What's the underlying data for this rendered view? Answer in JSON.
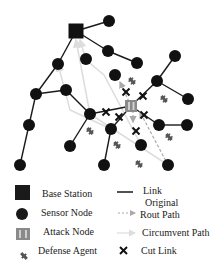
{
  "colors": {
    "link": "#1a1a1a",
    "node": "#111111",
    "base_station": "#111111",
    "attack_node": "#8a8a8a",
    "original_path": "#aaaaaa",
    "circumvent_path": "#dddddd",
    "cut_link": "#111111",
    "defense_agent": "#555555"
  },
  "base_station": {
    "x": 76,
    "y": 31,
    "size": 15
  },
  "attack_node": {
    "x": 131,
    "y": 106,
    "size": 12
  },
  "nodes": [
    {
      "id": "n1",
      "x": 109,
      "y": 21
    },
    {
      "id": "n2",
      "x": 86,
      "y": 59
    },
    {
      "id": "n3",
      "x": 108,
      "y": 51
    },
    {
      "id": "n4",
      "x": 137,
      "y": 63
    },
    {
      "id": "n5",
      "x": 58,
      "y": 64
    },
    {
      "id": "n6",
      "x": 115,
      "y": 75
    },
    {
      "id": "n7",
      "x": 175,
      "y": 56
    },
    {
      "id": "n8",
      "x": 157,
      "y": 81
    },
    {
      "id": "n9",
      "x": 188,
      "y": 99
    },
    {
      "id": "n10",
      "x": 36,
      "y": 94
    },
    {
      "id": "n11",
      "x": 66,
      "y": 90
    },
    {
      "id": "n12",
      "x": 90,
      "y": 114
    },
    {
      "id": "n13",
      "x": 29,
      "y": 125
    },
    {
      "id": "n14",
      "x": 111,
      "y": 129
    },
    {
      "id": "n15",
      "x": 159,
      "y": 125
    },
    {
      "id": "n16",
      "x": 187,
      "y": 125
    },
    {
      "id": "n17",
      "x": 70,
      "y": 146
    },
    {
      "id": "n18",
      "x": 141,
      "y": 145
    },
    {
      "id": "n19",
      "x": 20,
      "y": 165
    },
    {
      "id": "n20",
      "x": 104,
      "y": 165
    },
    {
      "id": "n21",
      "x": 168,
      "y": 165
    }
  ],
  "links": [
    [
      "bs",
      "n1"
    ],
    [
      "bs",
      "n5"
    ],
    [
      "bs",
      "n3"
    ],
    [
      "n3",
      "n4"
    ],
    [
      "n5",
      "n10"
    ],
    [
      "n10",
      "n11"
    ],
    [
      "n10",
      "n13"
    ],
    [
      "n13",
      "n19"
    ],
    [
      "n11",
      "n12"
    ],
    [
      "n12",
      "n17"
    ],
    [
      "n12",
      "atk"
    ],
    [
      "n7",
      "n8"
    ],
    [
      "n8",
      "n9"
    ],
    [
      "n8",
      "atk"
    ],
    [
      "n15",
      "n16"
    ],
    [
      "atk",
      "n15"
    ],
    [
      "atk",
      "n14"
    ],
    [
      "n14",
      "n20"
    ]
  ],
  "original_paths": [
    {
      "from": [
        131,
        106
      ],
      "to": [
        120,
        82
      ]
    },
    {
      "from": [
        133,
        110
      ],
      "to": [
        133,
        122
      ]
    },
    {
      "from": [
        168,
        165
      ],
      "to": [
        140,
        112
      ]
    }
  ],
  "circumvent_paths": [
    [
      [
        168,
        165
      ],
      [
        90,
        114
      ],
      [
        76,
        40
      ]
    ],
    [
      [
        141,
        145
      ],
      [
        104,
        75
      ],
      [
        86,
        60
      ],
      [
        80,
        40
      ]
    ],
    [
      [
        111,
        129
      ],
      [
        70,
        110
      ],
      [
        58,
        64
      ]
    ]
  ],
  "cut_links": [
    {
      "x": 126,
      "y": 92
    },
    {
      "x": 143,
      "y": 96
    },
    {
      "x": 106,
      "y": 112
    },
    {
      "x": 119,
      "y": 117
    },
    {
      "x": 144,
      "y": 115
    },
    {
      "x": 136,
      "y": 131
    }
  ],
  "defense_agents": [
    {
      "x": 132,
      "y": 81
    },
    {
      "x": 164,
      "y": 99
    },
    {
      "x": 90,
      "y": 131
    },
    {
      "x": 117,
      "y": 145
    },
    {
      "x": 169,
      "y": 137
    },
    {
      "x": 139,
      "y": 164
    }
  ],
  "legend": {
    "left": [
      {
        "icon": "base-station-icon",
        "label": "Base Station"
      },
      {
        "icon": "sensor-node-icon",
        "label": "Sensor Node"
      },
      {
        "icon": "attack-node-icon",
        "label": "Attack Node"
      },
      {
        "icon": "defense-agent-icon",
        "label": "Defense Agent"
      }
    ],
    "right": [
      {
        "icon": "link-line-icon",
        "label": "Link"
      },
      {
        "icon": "original-path-arrow-icon",
        "label_line1": "Original",
        "label_line2": "Rout Path"
      },
      {
        "icon": "circumvent-path-arrow-icon",
        "label": "Circumvent Path"
      },
      {
        "icon": "cut-link-icon",
        "label": "Cut Link"
      }
    ]
  }
}
